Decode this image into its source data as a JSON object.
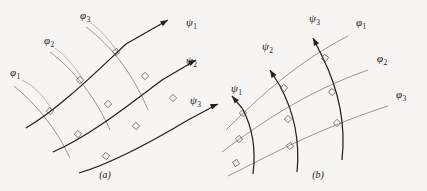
{
  "figure": {
    "background_color": "#f6f5f3",
    "psi_curve_color": "#222222",
    "phi_curve_color": "#8c8c8c",
    "leader_color": "#9a9a9a",
    "angle_mark_color": "#555555",
    "width": 427,
    "height": 191
  },
  "panels": [
    {
      "id": "a",
      "caption": "(a)",
      "caption_x": 105,
      "caption_y": 178,
      "psi_family": {
        "symbol": "ψ",
        "description": "dark arrowed curves arcing up to the right",
        "members": [
          {
            "label": "ψ",
            "subscript": "1",
            "label_x": 186,
            "label_y": 26,
            "path": "M 26,128 C 60,108 96,72 126,44 L 168,20",
            "arrow_at": [
              168,
              20
            ],
            "arrow_angle_deg": -30
          },
          {
            "label": "ψ",
            "subscript": "2",
            "label_x": 186,
            "label_y": 64,
            "path": "M 53,152 C 90,136 130,104 162,80 L 196,60",
            "arrow_at": [
              196,
              60
            ],
            "arrow_angle_deg": -26
          },
          {
            "label": "ψ",
            "subscript": "3",
            "label_x": 190,
            "label_y": 104,
            "path": "M 79,173 C 116,162 158,138 188,120 L 218,104",
            "arrow_at": [
              218,
              104
            ],
            "arrow_angle_deg": -22
          }
        ]
      },
      "phi_family": {
        "symbol": "φ",
        "description": "light gray curves crossing the psi curves at right angles",
        "members": [
          {
            "label": "φ",
            "subscript": "1",
            "label_x": 10,
            "label_y": 76,
            "leader": "M 22,80 C 34,86 44,96 52,110",
            "path": "M 14,86 C 36,104 56,128 70,158"
          },
          {
            "label": "φ",
            "subscript": "2",
            "label_x": 44,
            "label_y": 44,
            "leader": "M 55,48 C 66,56 74,66 82,78",
            "path": "M 50,52 C 74,70 96,98 110,130"
          },
          {
            "label": "φ",
            "subscript": "3",
            "label_x": 80,
            "label_y": 19,
            "leader": "M 91,23 C 102,31 110,41 118,53",
            "path": "M 86,27 C 112,46 134,76 148,110"
          }
        ]
      },
      "right_angle_marks": [
        {
          "x": 50,
          "y": 111,
          "rot": 40
        },
        {
          "x": 78,
          "y": 134,
          "rot": 38
        },
        {
          "x": 106,
          "y": 156,
          "rot": 36
        },
        {
          "x": 80,
          "y": 80,
          "rot": 48
        },
        {
          "x": 108,
          "y": 104,
          "rot": 44
        },
        {
          "x": 136,
          "y": 126,
          "rot": 40
        },
        {
          "x": 116,
          "y": 52,
          "rot": 55
        },
        {
          "x": 145,
          "y": 76,
          "rot": 50
        },
        {
          "x": 173,
          "y": 98,
          "rot": 46
        }
      ]
    },
    {
      "id": "b",
      "caption": "(b)",
      "caption_x": 318,
      "caption_y": 178,
      "psi_family": {
        "symbol": "ψ",
        "description": "dark arrowed curves sweeping up to the left",
        "members": [
          {
            "label": "ψ",
            "subscript": "1",
            "label_x": 231,
            "label_y": 92,
            "path": "M 253,174 C 256,150 252,126 242,108 L 232,96",
            "arrow_at": [
              232,
              96
            ],
            "arrow_angle_deg": -130
          },
          {
            "label": "ψ",
            "subscript": "2",
            "label_x": 262,
            "label_y": 50,
            "path": "M 297,172 C 300,142 294,112 280,86 L 270,70",
            "arrow_at": [
              270,
              70
            ],
            "arrow_angle_deg": -122
          },
          {
            "label": "ψ",
            "subscript": "3",
            "label_x": 309,
            "label_y": 22,
            "path": "M 342,160 C 346,124 338,88 322,56 L 313,38",
            "arrow_at": [
              313,
              38
            ],
            "arrow_angle_deg": -118
          }
        ]
      },
      "phi_family": {
        "symbol": "φ",
        "description": "light gray curves arcing to the right, labeled at their right ends",
        "members": [
          {
            "label": "φ",
            "subscript": "1",
            "label_x": 356,
            "label_y": 26,
            "path": "M 226,130 C 262,94 298,62 348,36"
          },
          {
            "label": "φ",
            "subscript": "2",
            "label_x": 377,
            "label_y": 62,
            "path": "M 222,152 C 262,122 306,92 368,70"
          },
          {
            "label": "φ",
            "subscript": "3",
            "label_x": 396,
            "label_y": 98,
            "path": "M 228,176 C 272,154 320,128 388,106"
          }
        ]
      },
      "right_angle_marks": [
        {
          "x": 243,
          "y": 113,
          "rot": -44
        },
        {
          "x": 239,
          "y": 139,
          "rot": -38
        },
        {
          "x": 236,
          "y": 163,
          "rot": -32
        },
        {
          "x": 284,
          "y": 88,
          "rot": -52
        },
        {
          "x": 288,
          "y": 119,
          "rot": -44
        },
        {
          "x": 290,
          "y": 146,
          "rot": -38
        },
        {
          "x": 325,
          "y": 58,
          "rot": -58
        },
        {
          "x": 332,
          "y": 92,
          "rot": -50
        },
        {
          "x": 337,
          "y": 123,
          "rot": -44
        }
      ]
    }
  ]
}
